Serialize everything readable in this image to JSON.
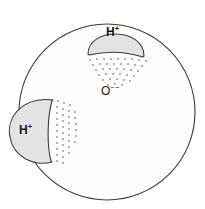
{
  "figure": {
    "background_color": "#ffffff",
    "width": 205,
    "height": 209
  },
  "styles": {
    "stroke_color": "#3a3a3a",
    "stroke_width": 1.1,
    "oxygen_fill": "#fefefe",
    "proton_fill": "#e3e3e3",
    "stipple_color": "#8d8d8d",
    "text_color": "#1a1a1a"
  },
  "oxygen": {
    "name": "oxygen-ion",
    "label": "O",
    "charge": "−−",
    "label_full": "O⁻⁻",
    "center_x": 107,
    "center_y": 112,
    "radius": 88
  },
  "protons": [
    {
      "name": "proton-top",
      "label": "H",
      "charge": "+",
      "label_full": "H⁺",
      "center_x": 116,
      "center_y": 48,
      "radius": 29,
      "position": "top"
    },
    {
      "name": "proton-left",
      "label": "H",
      "charge": "+",
      "label_full": "H⁺",
      "center_x": 32,
      "center_y": 131,
      "radius": 31,
      "position": "left"
    }
  ],
  "stipple_regions": [
    {
      "name": "stipple-top",
      "description": "dotted charge cloud below top proton"
    },
    {
      "name": "stipple-left",
      "description": "dotted charge cloud right of left proton"
    }
  ]
}
